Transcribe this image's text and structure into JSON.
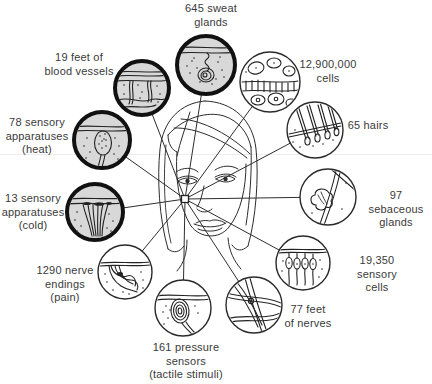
{
  "diagram": {
    "type": "labeled-illustration",
    "subject_icon": "woman-face-line-drawing",
    "hub_icon": "hub-square-marker",
    "colors": {
      "ink": "#222222",
      "text": "#3a3a3a",
      "highlight_inset_fill": "#d8d8d8",
      "plain_inset_fill": "#ffffff",
      "background": "#ffffff"
    },
    "callouts": [
      {
        "id": "sweat-glands",
        "label": "645 sweat\nglands",
        "icon": "sweat-gland-magnified-inset",
        "inset_style": "thick-ring"
      },
      {
        "id": "blood-vessels",
        "label": "19 feet of\nblood vessels",
        "icon": "blood-vessels-magnified-inset",
        "inset_style": "thick-ring"
      },
      {
        "id": "cells",
        "label": "12,900,000\ncells",
        "icon": "skin-cells-magnified-inset",
        "inset_style": "thin-ring"
      },
      {
        "id": "hairs",
        "label": "65 hairs",
        "icon": "hairs-magnified-inset",
        "inset_style": "thin-ring"
      },
      {
        "id": "heat-sensors",
        "label": "78 sensory\napparatuses\n(heat)",
        "icon": "heat-receptor-magnified-inset",
        "inset_style": "thick-ring"
      },
      {
        "id": "sebaceous-glands",
        "label": "97 sebaceous\nglands",
        "icon": "sebaceous-gland-magnified-inset",
        "inset_style": "thin-ring"
      },
      {
        "id": "cold-sensors",
        "label": "13 sensory\napparatuses\n(cold)",
        "icon": "cold-receptor-magnified-inset",
        "inset_style": "thick-ring"
      },
      {
        "id": "nerve-endings",
        "label": "1290 nerve\nendings\n(pain)",
        "icon": "nerve-endings-magnified-inset",
        "inset_style": "thin-ring"
      },
      {
        "id": "sensory-cells",
        "label": "19,350 sensory\ncells",
        "icon": "sensory-cells-magnified-inset",
        "inset_style": "thin-ring"
      },
      {
        "id": "nerves",
        "label": "77 feet\nof nerves",
        "icon": "nerve-fibers-magnified-inset",
        "inset_style": "thin-ring"
      },
      {
        "id": "pressure-sensors",
        "label": "161 pressure\nsensors\n(tactile stimuli)",
        "icon": "pressure-corpuscle-magnified-inset",
        "inset_style": "thin-ring"
      }
    ]
  }
}
